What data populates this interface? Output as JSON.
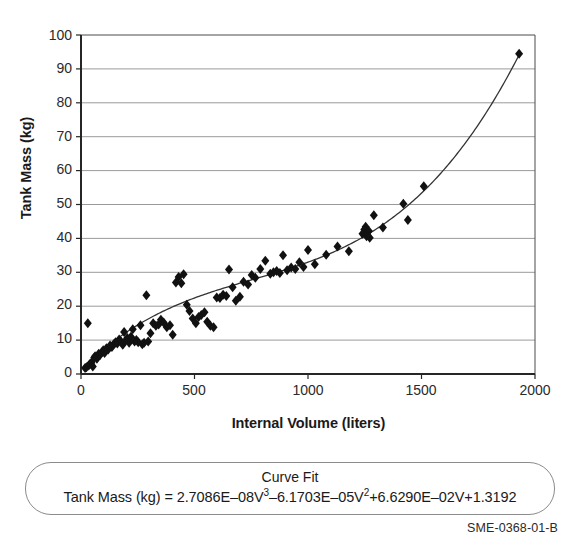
{
  "figure": {
    "doc_id": "SME-0368-01-B",
    "caption_title": "Curve Fit",
    "caption_equation_text": "Tank Mass (kg) = 2.7086E–08V3–6.1703E–05V2+6.6290E–02V+1.3192"
  },
  "caption": {
    "eq_lhs": "Tank Mass (kg) = 2.7086E–08V",
    "eq_sup1": "3",
    "eq_mid": "–6.1703E–05V",
    "eq_sup2": "2",
    "eq_tail": "+6.6290E–02V+1.3192"
  },
  "chart_data": {
    "type": "scatter",
    "title": "",
    "xlabel": "Internal Volume (liters)",
    "ylabel": "Tank Mass (kg)",
    "xlim": [
      0,
      2000
    ],
    "ylim": [
      0,
      100
    ],
    "xticks": [
      0,
      500,
      1000,
      1500,
      2000
    ],
    "yticks": [
      0,
      10,
      20,
      30,
      40,
      50,
      60,
      70,
      80,
      90,
      100
    ],
    "grid": "horizontal",
    "legend": "none",
    "marker": "diamond",
    "marker_color": "#111111",
    "fit_color": "#2b2b2b",
    "fit_label": "Curve Fit",
    "fit_equation": {
      "form": "cubic",
      "coefficients": {
        "V3": 2.7086e-08,
        "V2": -6.1703e-05,
        "V1": 0.06629,
        "V0": 1.3192
      }
    },
    "points": [
      [
        18,
        1.8
      ],
      [
        24,
        2.0
      ],
      [
        30,
        15.0
      ],
      [
        34,
        2.5
      ],
      [
        40,
        3.0
      ],
      [
        46,
        3.3
      ],
      [
        52,
        2.2
      ],
      [
        58,
        4.8
      ],
      [
        62,
        5.2
      ],
      [
        70,
        4.5
      ],
      [
        78,
        6.0
      ],
      [
        84,
        5.6
      ],
      [
        92,
        6.4
      ],
      [
        98,
        7.0
      ],
      [
        104,
        6.2
      ],
      [
        112,
        7.6
      ],
      [
        120,
        7.2
      ],
      [
        128,
        8.4
      ],
      [
        136,
        8.0
      ],
      [
        144,
        8.8
      ],
      [
        152,
        9.4
      ],
      [
        160,
        9.0
      ],
      [
        168,
        10.2
      ],
      [
        176,
        9.6
      ],
      [
        184,
        8.6
      ],
      [
        190,
        12.4
      ],
      [
        196,
        9.8
      ],
      [
        204,
        10.6
      ],
      [
        212,
        9.2
      ],
      [
        220,
        11.0
      ],
      [
        228,
        13.2
      ],
      [
        236,
        9.6
      ],
      [
        244,
        10.0
      ],
      [
        252,
        9.4
      ],
      [
        262,
        14.4
      ],
      [
        270,
        8.8
      ],
      [
        278,
        9.2
      ],
      [
        288,
        23.2
      ],
      [
        296,
        9.6
      ],
      [
        306,
        12.0
      ],
      [
        318,
        15.0
      ],
      [
        330,
        14.2
      ],
      [
        342,
        14.6
      ],
      [
        352,
        16.0
      ],
      [
        364,
        15.2
      ],
      [
        378,
        13.8
      ],
      [
        392,
        14.4
      ],
      [
        404,
        11.6
      ],
      [
        418,
        27.0
      ],
      [
        430,
        28.6
      ],
      [
        442,
        26.8
      ],
      [
        452,
        29.4
      ],
      [
        466,
        20.4
      ],
      [
        478,
        18.6
      ],
      [
        492,
        16.4
      ],
      [
        506,
        15.0
      ],
      [
        518,
        16.8
      ],
      [
        530,
        17.4
      ],
      [
        544,
        18.2
      ],
      [
        556,
        15.4
      ],
      [
        570,
        14.2
      ],
      [
        584,
        13.8
      ],
      [
        598,
        22.6
      ],
      [
        612,
        22.4
      ],
      [
        626,
        23.4
      ],
      [
        640,
        23.0
      ],
      [
        652,
        30.8
      ],
      [
        668,
        25.6
      ],
      [
        682,
        21.6
      ],
      [
        700,
        22.8
      ],
      [
        716,
        27.2
      ],
      [
        736,
        26.4
      ],
      [
        752,
        29.2
      ],
      [
        768,
        28.4
      ],
      [
        790,
        31.0
      ],
      [
        812,
        33.4
      ],
      [
        834,
        29.6
      ],
      [
        848,
        30.0
      ],
      [
        862,
        30.4
      ],
      [
        876,
        29.8
      ],
      [
        890,
        35.0
      ],
      [
        908,
        30.6
      ],
      [
        926,
        31.4
      ],
      [
        944,
        31.0
      ],
      [
        962,
        33.0
      ],
      [
        980,
        31.6
      ],
      [
        1000,
        36.6
      ],
      [
        1030,
        32.4
      ],
      [
        1080,
        35.2
      ],
      [
        1130,
        37.6
      ],
      [
        1180,
        36.2
      ],
      [
        1240,
        41.4
      ],
      [
        1248,
        42.6
      ],
      [
        1254,
        43.4
      ],
      [
        1258,
        40.6
      ],
      [
        1262,
        41.8
      ],
      [
        1268,
        42.2
      ],
      [
        1272,
        40.2
      ],
      [
        1290,
        46.8
      ],
      [
        1330,
        43.2
      ],
      [
        1420,
        50.2
      ],
      [
        1440,
        45.4
      ],
      [
        1510,
        55.4
      ],
      [
        1930,
        94.5
      ]
    ],
    "fit_curve_note": "Cubic polynomial fit drawn from V=0 to V=1930"
  },
  "axes": {
    "y_tick_labels": [
      "100",
      "90",
      "80",
      "70",
      "60",
      "50",
      "40",
      "30",
      "20",
      "10",
      "0"
    ],
    "x_tick_labels": [
      "0",
      "500",
      "1000",
      "1500",
      "2000"
    ]
  }
}
